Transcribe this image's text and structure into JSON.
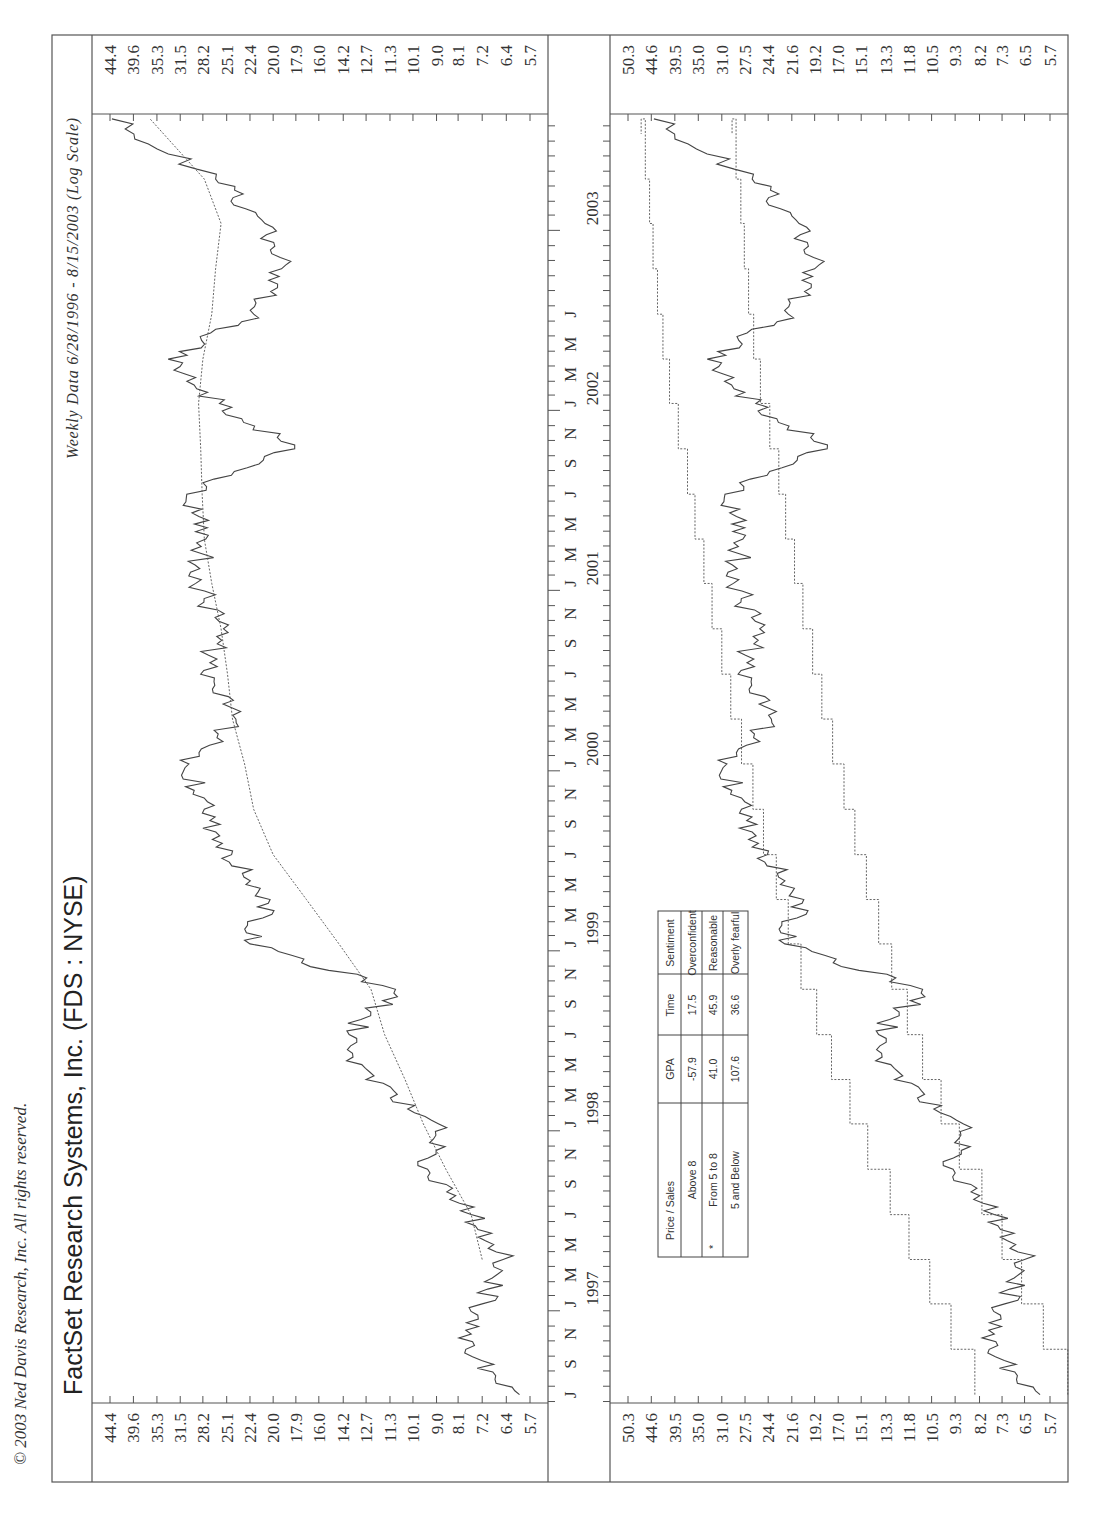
{
  "copyright": "© 2003 Ned Davis Research, Inc. All rights reserved.",
  "title": "FactSet Research Systems, Inc. (FDS : NYSE)",
  "subtitle": "Weekly Data 6/28/1996 - 8/15/2003 (Log Scale)",
  "colors": {
    "line": "#444444",
    "frame": "#555555",
    "background": "#ffffff"
  },
  "date_axis": {
    "month_letters": [
      "J",
      "S",
      "N",
      "J",
      "M",
      "M",
      "J",
      "S",
      "N",
      "J",
      "M",
      "M",
      "J",
      "S",
      "N",
      "J",
      "M",
      "M",
      "J",
      "S",
      "N",
      "J",
      "M",
      "M",
      "J",
      "S",
      "N",
      "J",
      "M",
      "M",
      "J",
      "S",
      "N",
      "J",
      "M",
      "M",
      "J"
    ],
    "years": [
      "1997",
      "1998",
      "1999",
      "2000",
      "2001",
      "2002",
      "2003"
    ]
  },
  "table": {
    "headers": [
      "Price / Sales",
      "GPA",
      "Time",
      "Sentiment"
    ],
    "rows": [
      {
        "range": "Above 8",
        "gpa": "-57.9",
        "time": "17.5",
        "sentiment": "Overconfident",
        "current": false
      },
      {
        "range": "From 5 to 8",
        "gpa": "41.0",
        "time": "45.9",
        "sentiment": "Reasonable",
        "current": true
      },
      {
        "range": "5 and Below",
        "gpa": "107.6",
        "time": "36.6",
        "sentiment": "Overly fearful",
        "current": false
      }
    ],
    "current_marker": "*"
  },
  "chart_data": [
    {
      "type": "line",
      "title": "FactSet Research Systems, Inc. (FDS : NYSE)",
      "subtitle": "Weekly Data 6/28/1996 - 8/15/2003 (Log Scale)",
      "panel": "top",
      "y_scale": "log",
      "y_ticks": [
        44.4,
        39.6,
        35.3,
        31.5,
        28.2,
        25.1,
        22.4,
        20.0,
        17.9,
        16.0,
        14.2,
        12.7,
        11.3,
        10.1,
        9.0,
        8.1,
        7.2,
        6.4,
        5.7
      ],
      "ylim": [
        5.7,
        44.4
      ],
      "x_range": [
        "1996-06",
        "2003-08"
      ],
      "x": [
        "1996-07",
        "1996-10",
        "1997-01",
        "1997-04",
        "1997-07",
        "1997-10",
        "1998-01",
        "1998-04",
        "1998-07",
        "1998-10",
        "1999-01",
        "1999-04",
        "1999-07",
        "1999-10",
        "2000-01",
        "2000-04",
        "2000-07",
        "2000-10",
        "2001-01",
        "2001-04",
        "2001-07",
        "2001-10",
        "2002-01",
        "2002-04",
        "2002-07",
        "2002-10",
        "2003-01",
        "2003-04",
        "2003-08"
      ],
      "series": [
        {
          "name": "FDS weekly price",
          "style": "solid",
          "values": [
            6.0,
            7.8,
            7.2,
            6.5,
            7.6,
            9.4,
            8.9,
            12.7,
            13.8,
            11.0,
            22.4,
            20.3,
            24.5,
            28.0,
            30.2,
            24.0,
            28.5,
            25.5,
            29.2,
            27.8,
            30.5,
            18.0,
            26.0,
            33.4,
            22.0,
            19.2,
            20.8,
            26.5,
            44.0
          ]
        },
        {
          "name": "Moving average",
          "style": "dotted",
          "values": [
            null,
            null,
            null,
            7.2,
            7.6,
            8.6,
            9.6,
            10.5,
            11.6,
            12.4,
            14.5,
            17.0,
            20.0,
            22.0,
            23.0,
            24.4,
            25.0,
            25.8,
            27.0,
            28.0,
            28.3,
            28.5,
            28.8,
            28.2,
            27.0,
            26.5,
            25.8,
            28.0,
            36.5
          ]
        }
      ]
    },
    {
      "type": "line",
      "panel": "bottom",
      "y_scale": "log",
      "y_ticks": [
        50.3,
        44.6,
        39.5,
        35.0,
        31.0,
        27.5,
        24.4,
        21.6,
        19.2,
        17.0,
        15.1,
        13.3,
        11.8,
        10.5,
        9.3,
        8.2,
        7.3,
        6.5,
        5.7
      ],
      "ylim": [
        5.7,
        50.3
      ],
      "x": [
        "1996-07",
        "1996-10",
        "1997-01",
        "1997-04",
        "1997-07",
        "1997-10",
        "1998-01",
        "1998-04",
        "1998-07",
        "1998-10",
        "1999-01",
        "1999-04",
        "1999-07",
        "1999-10",
        "2000-01",
        "2000-04",
        "2000-07",
        "2000-10",
        "2001-01",
        "2001-04",
        "2001-07",
        "2001-10",
        "2002-01",
        "2002-04",
        "2002-07",
        "2002-10",
        "2003-01",
        "2003-04",
        "2003-08"
      ],
      "series": [
        {
          "name": "FDS weekly price",
          "style": "solid",
          "values": [
            6.0,
            7.8,
            7.2,
            6.5,
            7.6,
            9.4,
            8.9,
            12.7,
            13.8,
            11.0,
            22.4,
            20.3,
            24.5,
            28.0,
            30.2,
            24.0,
            28.5,
            25.5,
            29.2,
            27.8,
            30.5,
            18.0,
            26.0,
            33.4,
            22.0,
            19.2,
            20.8,
            26.5,
            44.0
          ]
        },
        {
          "name": "Price/Sales = 8 band",
          "style": "dotted-step",
          "values": [
            8.4,
            9.5,
            10.6,
            11.8,
            13.0,
            14.6,
            16.0,
            17.6,
            19.0,
            20.6,
            22.0,
            23.4,
            25.0,
            26.4,
            28.0,
            29.6,
            31.0,
            32.6,
            34.0,
            35.6,
            37.0,
            38.8,
            40.6,
            42.0,
            43.2,
            44.2,
            45.0,
            46.0,
            47.0
          ]
        },
        {
          "name": "Price/Sales = 5 band",
          "style": "dotted-step",
          "values": [
            5.2,
            5.9,
            6.6,
            7.3,
            8.1,
            9.1,
            10.0,
            11.0,
            11.9,
            12.9,
            13.8,
            14.7,
            15.6,
            16.5,
            17.5,
            18.5,
            19.4,
            20.4,
            21.3,
            22.3,
            23.1,
            24.2,
            25.4,
            26.3,
            27.0,
            27.6,
            28.1,
            28.8,
            29.4
          ]
        }
      ]
    }
  ]
}
